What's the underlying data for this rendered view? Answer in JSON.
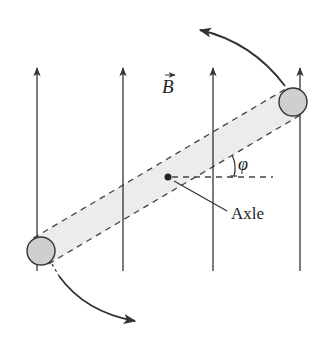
{
  "figure": {
    "field_label": "B",
    "field_label_has_vector_arrow": true,
    "angle_label": "φ",
    "axle_label": "Axle",
    "colors": {
      "stroke": "#333333",
      "rod_fill": "#ececec",
      "sphere_fill": "#cfcfcf",
      "dash": "#444444",
      "background": "#ffffff"
    },
    "field_lines": [
      {
        "x": 37,
        "y_top": 66,
        "y_bottom": 271
      },
      {
        "x": 123,
        "y_top": 66,
        "y_bottom": 271
      },
      {
        "x": 213,
        "y_top": 66,
        "y_bottom": 271
      },
      {
        "x": 300,
        "y_top": 66,
        "y_bottom": 271
      }
    ],
    "rod": {
      "end_a": {
        "x": 41,
        "y": 251
      },
      "end_b": {
        "x": 293,
        "y": 102
      },
      "half_width": 15,
      "angle_deg": 30.6
    },
    "spheres": [
      {
        "name": "lower-left",
        "cx": 41,
        "cy": 251,
        "r": 14
      },
      {
        "name": "upper-right",
        "cx": 293,
        "cy": 102,
        "r": 14
      }
    ],
    "axle": {
      "x": 168,
      "y": 177,
      "r": 3.5
    },
    "rotation_arrows": [
      {
        "name": "upper",
        "from": [
          285,
          86
        ],
        "ctrl": [
          252,
          42
        ],
        "to": [
          198,
          29
        ]
      },
      {
        "name": "lower",
        "from": [
          59,
          276
        ],
        "ctrl": [
          85,
          312
        ],
        "to": [
          137,
          322
        ]
      }
    ]
  }
}
